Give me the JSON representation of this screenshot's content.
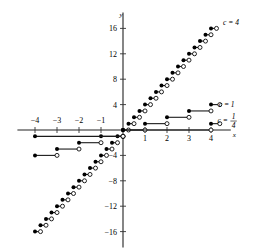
{
  "figure": {
    "axis_x_name": "x",
    "axis_y_name": "y"
  },
  "axes": {
    "x_ticks": [
      {
        "value": -4,
        "label": "−4"
      },
      {
        "value": -3,
        "label": "−3"
      },
      {
        "value": -2,
        "label": "−2"
      },
      {
        "value": -1,
        "label": "−1"
      },
      {
        "value": 1,
        "label": "1"
      },
      {
        "value": 2,
        "label": "2"
      },
      {
        "value": 3,
        "label": "3"
      },
      {
        "value": 4,
        "label": "4"
      }
    ],
    "y_ticks": [
      {
        "value": 16,
        "label": "16"
      },
      {
        "value": 12,
        "label": "12"
      },
      {
        "value": 8,
        "label": "8"
      },
      {
        "value": 4,
        "label": "4"
      },
      {
        "value": -4,
        "label": "−4"
      },
      {
        "value": -8,
        "label": "−8"
      },
      {
        "value": -12,
        "label": "−12"
      },
      {
        "value": -16,
        "label": "−16"
      }
    ],
    "xlim": [
      -4.8,
      4.9
    ],
    "ylim": [
      -18.5,
      18.5
    ]
  },
  "curve_labels": [
    {
      "id": "c4",
      "text": "c = 4",
      "x": 4.55,
      "y": 17.0
    },
    {
      "id": "c1",
      "text": "c = 1",
      "x": 4.35,
      "y": 4.1
    },
    {
      "id": "c025",
      "text": "c =",
      "numerator": "1",
      "denominator": "4",
      "x": 4.3,
      "y": 1.6
    }
  ],
  "chart_data": {
    "type": "line",
    "title": "",
    "xlabel": "x",
    "ylabel": "y",
    "xlim": [
      -4.8,
      4.9
    ],
    "ylim": [
      -18.5,
      18.5
    ],
    "grid": false,
    "legend_position": "right-inline",
    "marker_note": "filled dot = closed endpoint, open circle = open endpoint",
    "series": [
      {
        "name": "c = 4",
        "label": "c = 4",
        "step_width": 0.25,
        "step_rise": 1.0,
        "description": "staircase of short horizontal segments, width 1/4 in x and rise 1 in y, passing through the origin",
        "segments": [
          {
            "x0": -4.0,
            "x1": -3.75,
            "y": -16
          },
          {
            "x0": -3.75,
            "x1": -3.5,
            "y": -15
          },
          {
            "x0": -3.5,
            "x1": -3.25,
            "y": -14
          },
          {
            "x0": -3.25,
            "x1": -3.0,
            "y": -13
          },
          {
            "x0": -3.0,
            "x1": -2.75,
            "y": -12
          },
          {
            "x0": -2.75,
            "x1": -2.5,
            "y": -11
          },
          {
            "x0": -2.5,
            "x1": -2.25,
            "y": -10
          },
          {
            "x0": -2.25,
            "x1": -2.0,
            "y": -9
          },
          {
            "x0": -2.0,
            "x1": -1.75,
            "y": -8
          },
          {
            "x0": -1.75,
            "x1": -1.5,
            "y": -7
          },
          {
            "x0": -1.5,
            "x1": -1.25,
            "y": -6
          },
          {
            "x0": -1.25,
            "x1": -1.0,
            "y": -5
          },
          {
            "x0": -1.0,
            "x1": -0.75,
            "y": -4
          },
          {
            "x0": -0.75,
            "x1": -0.5,
            "y": -3
          },
          {
            "x0": -0.5,
            "x1": -0.25,
            "y": -2
          },
          {
            "x0": -0.25,
            "x1": 0.0,
            "y": -1
          },
          {
            "x0": 0.0,
            "x1": 0.25,
            "y": 0
          },
          {
            "x0": 0.25,
            "x1": 0.5,
            "y": 1
          },
          {
            "x0": 0.5,
            "x1": 0.75,
            "y": 2
          },
          {
            "x0": 0.75,
            "x1": 1.0,
            "y": 3
          },
          {
            "x0": 1.0,
            "x1": 1.25,
            "y": 4
          },
          {
            "x0": 1.25,
            "x1": 1.5,
            "y": 5
          },
          {
            "x0": 1.5,
            "x1": 1.75,
            "y": 6
          },
          {
            "x0": 1.75,
            "x1": 2.0,
            "y": 7
          },
          {
            "x0": 2.0,
            "x1": 2.25,
            "y": 8
          },
          {
            "x0": 2.25,
            "x1": 2.5,
            "y": 9
          },
          {
            "x0": 2.5,
            "x1": 2.75,
            "y": 10
          },
          {
            "x0": 2.75,
            "x1": 3.0,
            "y": 11
          },
          {
            "x0": 3.0,
            "x1": 3.25,
            "y": 12
          },
          {
            "x0": 3.25,
            "x1": 3.5,
            "y": 13
          },
          {
            "x0": 3.5,
            "x1": 3.75,
            "y": 14
          },
          {
            "x0": 3.75,
            "x1": 4.0,
            "y": 15
          },
          {
            "x0": 4.0,
            "x1": 4.25,
            "y": 16
          }
        ]
      },
      {
        "name": "c = 1",
        "label": "c = 1",
        "step_width": 1.0,
        "step_rise": 1.0,
        "description": "unit staircase, horizontal segments of width 1 rising by 1",
        "segments": [
          {
            "x0": -4.0,
            "x1": -3.0,
            "y": -4
          },
          {
            "x0": -3.0,
            "x1": -2.0,
            "y": -3
          },
          {
            "x0": -2.0,
            "x1": -1.0,
            "y": -2
          },
          {
            "x0": -1.0,
            "x1": 0.0,
            "y": -1
          },
          {
            "x0": 0.0,
            "x1": 1.0,
            "y": 0
          },
          {
            "x0": 1.0,
            "x1": 2.0,
            "y": 1
          },
          {
            "x0": 2.0,
            "x1": 3.0,
            "y": 2
          },
          {
            "x0": 3.0,
            "x1": 4.0,
            "y": 3
          },
          {
            "x0": 4.0,
            "x1": 4.4,
            "y": 4
          }
        ]
      },
      {
        "name": "c = 1/4",
        "label": "c = 1/4",
        "step_width": 4.0,
        "step_rise": 1.0,
        "description": "wide staircase, horizontal segments of width 4 rising by 1",
        "segments": [
          {
            "x0": -4.0,
            "x1": 0.0,
            "y": -1
          },
          {
            "x0": 0.0,
            "x1": 4.0,
            "y": 0
          },
          {
            "x0": 4.0,
            "x1": 4.4,
            "y": 1
          }
        ]
      }
    ]
  }
}
